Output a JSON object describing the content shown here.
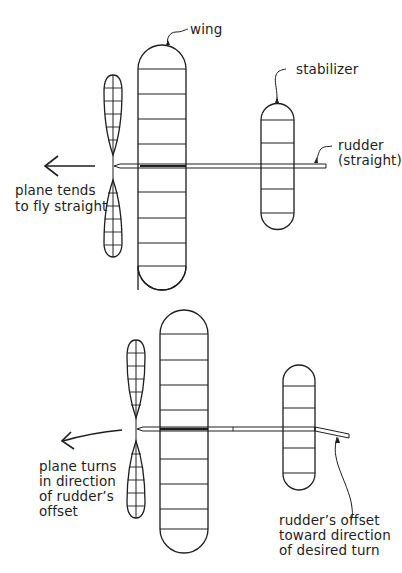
{
  "panels": [
    {
      "id": "straight",
      "labels": {
        "wing": "wing",
        "stabilizer": "stabilizer",
        "rudder_line1": "rudder",
        "rudder_line2": "(straight)",
        "result_line1": "plane tends",
        "result_line2": "to fly straight"
      }
    },
    {
      "id": "turn",
      "labels": {
        "result_line1": "plane turns",
        "result_line2": "in direction",
        "result_line3": "of rudder’s",
        "result_line4": "offset",
        "rudder_line1": "rudder’s offset",
        "rudder_line2": "toward direction",
        "rudder_line3": "of desired turn"
      }
    }
  ],
  "colors": {
    "ink": "#1e1e1e",
    "background": "#ffffff"
  }
}
